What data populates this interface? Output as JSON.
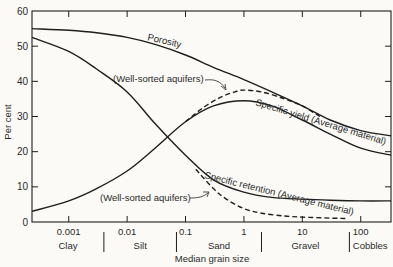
{
  "chart_data": {
    "type": "line",
    "title": "",
    "xlabel": "Median grain size",
    "ylabel": "Per cent",
    "xscale": "log",
    "xlim": [
      0.000235,
      330
    ],
    "ylim": [
      0,
      60
    ],
    "yticks": [
      0,
      10,
      20,
      30,
      40,
      50,
      60
    ],
    "xticks": [
      {
        "value": 0.001,
        "label": "0.001"
      },
      {
        "value": 0.01,
        "label": "0.01"
      },
      {
        "value": 0.1,
        "label": "0.1"
      },
      {
        "value": 1,
        "label": "1"
      },
      {
        "value": 10,
        "label": "10"
      },
      {
        "value": 100,
        "label": "100"
      }
    ],
    "grain_classes": [
      {
        "label": "Clay",
        "from": 0.000235,
        "to": 0.004
      },
      {
        "label": "Silt",
        "from": 0.004,
        "to": 0.07
      },
      {
        "label": "Sand",
        "from": 0.07,
        "to": 2
      },
      {
        "label": "Gravel",
        "from": 2,
        "to": 64
      },
      {
        "label": "Cobbles",
        "from": 64,
        "to": 330
      }
    ],
    "grid": false,
    "legend": "none (curves labeled inline)",
    "series": [
      {
        "name": "Porosity",
        "style": "solid",
        "x": [
          0.000235,
          0.001,
          0.003,
          0.01,
          0.03,
          0.1,
          0.3,
          1,
          3,
          10,
          30,
          100,
          330
        ],
        "y": [
          55,
          54.5,
          53.8,
          52.5,
          50.5,
          47.5,
          44,
          40.5,
          37,
          33,
          29,
          26,
          24.5
        ]
      },
      {
        "name": "Specific yield (Average material)",
        "style": "solid",
        "x": [
          0.000235,
          0.001,
          0.003,
          0.01,
          0.03,
          0.1,
          0.3,
          1,
          3,
          10,
          30,
          100,
          330
        ],
        "y": [
          3,
          6,
          9.5,
          14.5,
          21,
          28.5,
          33,
          34.5,
          33,
          29,
          25,
          21,
          19
        ]
      },
      {
        "name": "Specific retention (Average material)",
        "style": "solid",
        "x": [
          0.000235,
          0.001,
          0.003,
          0.01,
          0.03,
          0.1,
          0.3,
          1,
          3,
          10,
          30,
          100,
          330
        ],
        "y": [
          52.5,
          48.5,
          43.5,
          37,
          28,
          19,
          12,
          8.5,
          7,
          6.5,
          6.2,
          6,
          6
        ]
      },
      {
        "name": "Specific yield (Well-sorted aquifers)",
        "style": "dashed",
        "x": [
          0.1,
          0.2,
          0.4,
          0.7,
          1,
          2,
          5,
          10,
          20
        ],
        "y": [
          28.5,
          32.5,
          35.5,
          37,
          37.5,
          37,
          35,
          33,
          30
        ]
      },
      {
        "name": "Specific retention (Well-sorted aquifers)",
        "style": "dashed",
        "x": [
          0.15,
          0.3,
          0.5,
          1,
          2,
          5,
          10,
          30,
          60
        ],
        "y": [
          15,
          9.5,
          6.5,
          3.8,
          2.5,
          1.7,
          1.4,
          1.1,
          1
        ]
      }
    ],
    "annotations": [
      {
        "text": "Porosity"
      },
      {
        "text": "(Well-sorted aquifers)",
        "points_to": "Specific yield (Well-sorted aquifers)"
      },
      {
        "text": "Specific yield (Average material)"
      },
      {
        "text": "Specific retention (Average material)"
      },
      {
        "text": "(Well-sorted aquifers)",
        "points_to": "Specific retention (Well-sorted aquifers)"
      }
    ]
  },
  "labels": {
    "ylabel": "Per cent",
    "xlabel": "Median grain size",
    "porosity": "Porosity",
    "well_sorted_upper": "(Well-sorted aquifers)",
    "specific_yield": "Specific yield (Average material)",
    "specific_retention": "Specific retention (Average material)",
    "well_sorted_lower": "(Well-sorted aquifers)"
  },
  "colors": {
    "background": "#fbfaf6",
    "line": "#1e1e1e",
    "text": "#2a2a2a"
  }
}
